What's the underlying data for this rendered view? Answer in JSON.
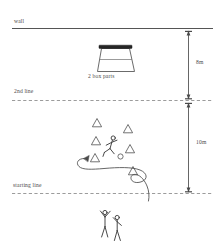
{
  "diagram": {
    "background_color": "#ffffff",
    "line_color": "#4a4a4a",
    "canvas": {
      "width": 218,
      "height": 251
    }
  },
  "labels": {
    "wall": "wall",
    "second_line": "2nd line",
    "starting_line": "starting line",
    "box": "2 box parts"
  },
  "dimensions": [
    {
      "id": "wall-to-2nd-line",
      "label": "8m",
      "from": "wall",
      "to": "2nd line"
    },
    {
      "id": "2nd-line-to-start",
      "label": "10m",
      "from": "2nd line",
      "to": "starting line"
    }
  ],
  "lines": [
    {
      "id": "wall-line",
      "style": "solid",
      "y": 28
    },
    {
      "id": "second-line",
      "style": "dashed",
      "y": 100
    },
    {
      "id": "starting-line",
      "style": "dashed",
      "y": 193
    }
  ],
  "equipment": {
    "box": {
      "name": "vaulting box",
      "parts": 2,
      "x": 115,
      "y": 58
    },
    "ball": {
      "name": "ball",
      "x": 120,
      "y": 156
    }
  },
  "cones": [
    {
      "x": 97,
      "y": 123
    },
    {
      "x": 128,
      "y": 129
    },
    {
      "x": 96,
      "y": 141
    },
    {
      "x": 130,
      "y": 149
    },
    {
      "x": 95,
      "y": 158
    },
    {
      "x": 133,
      "y": 171
    }
  ],
  "figures": [
    {
      "id": "runner",
      "pose": "running",
      "x": 110,
      "y": 147
    },
    {
      "id": "waiting-a",
      "pose": "arms-raised",
      "x": 105,
      "y": 221
    },
    {
      "id": "waiting-b",
      "pose": "standing",
      "x": 117,
      "y": 226
    }
  ],
  "path": {
    "id": "slalom-path",
    "description": "serpentine route from starting line through cones",
    "arrow_direction": "left"
  }
}
